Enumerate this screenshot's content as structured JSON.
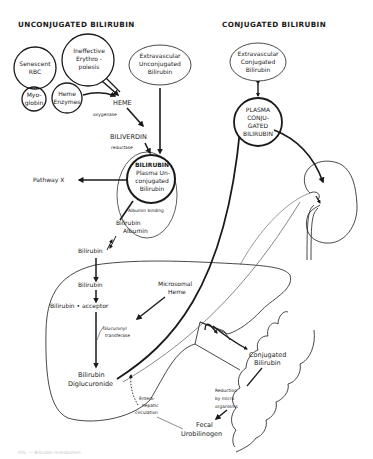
{
  "headers": {
    "unconjugated": "UNCONJUGATED BILIRUBIN",
    "conjugated": "CONJUGATED BILIRUBIN"
  },
  "sources": {
    "senescent_rbc": [
      "Senescent",
      "RBC"
    ],
    "ineffective_erythropoiesis": [
      "Ineffective",
      "Erythro -",
      "poiesis"
    ],
    "myoglobin": [
      "Myo-",
      "globin"
    ],
    "heme_enzymes": [
      "Heme",
      "Enzymes"
    ],
    "extravascular_unconjugated": [
      "Extravascular",
      "Unconjugated",
      "Bilirubin"
    ]
  },
  "pathway": {
    "heme": "HEME",
    "oxygenase": "oxygenase",
    "biliverdin": "BILIVERDIN",
    "reductase": "reductase",
    "plasma_unconjugated": [
      "BILIRUBIN",
      "Plasma Un-",
      "conjugated",
      "Bilirubin"
    ],
    "pathway_x": "Pathway X",
    "albumin_binding": "Albumin binding",
    "bilirubin_albumin": [
      "Bilirubin",
      "Albumin"
    ],
    "bilirubin_free": "Bilirubin"
  },
  "liver": {
    "bilirubin": "Bilirubin",
    "bilirubin_acceptor": "Bilirubin • acceptor",
    "microsomal_heme": [
      "Microsomal",
      "Heme"
    ],
    "glucuronyl_transferase": [
      "Glucuronyl",
      "transferase"
    ],
    "bilirubin_diglucuronide": [
      "Bilirubin",
      "Diglucuronide"
    ]
  },
  "conjugated_side": {
    "extravascular_conjugated": [
      "Extravascular",
      "Conjugated",
      "Bilirubin"
    ],
    "plasma_conjugated": [
      "PLASMA",
      "CONJU-",
      "GATED",
      "BILIRUBIN"
    ]
  },
  "intestine": {
    "conjugated_bilirubin": [
      "Conjugated",
      "Bilirubin"
    ],
    "reduction": [
      "Reduction",
      "by micro",
      "organisms"
    ],
    "fecal_urobilinogen": [
      "Fecal",
      "Urobilinogen"
    ],
    "enterohepatic": [
      "Entero-",
      "hepatic",
      "circulation"
    ]
  },
  "caption": "FIG. — Bilirubin metabolism",
  "colors": {
    "ink": "#1a1a1a",
    "faint": "#c8c8c8",
    "background": "#ffffff"
  }
}
